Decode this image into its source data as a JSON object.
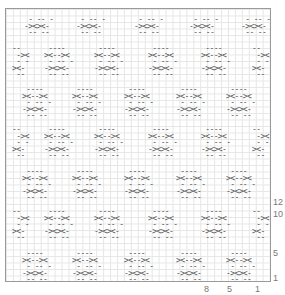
{
  "chart_data": {
    "type": "knitting-chart",
    "row_labels": [
      "12",
      "10",
      "5",
      "1"
    ],
    "col_labels": [
      "8",
      "5",
      "1"
    ],
    "motifs": {
      "a": [
        " - -- -",
        "-><><-",
        " -- --"
      ],
      "b": [
        " ----",
        "><--><",
        " - -- -",
        "-><><-",
        " -- --"
      ],
      "c": [
        "--",
        " -><",
        " - -",
        "><-",
        " --"
      ]
    },
    "rows": [
      {
        "y": 8,
        "items": [
          {
            "x": 18,
            "m": "a"
          },
          {
            "x": 70,
            "m": "a"
          },
          {
            "x": 128,
            "m": "a"
          },
          {
            "x": 183,
            "m": "a"
          },
          {
            "x": 235,
            "m": "a"
          }
        ]
      },
      {
        "y": 37,
        "items": [
          {
            "x": 6,
            "m": "c"
          },
          {
            "x": 38,
            "m": "b"
          },
          {
            "x": 88,
            "m": "b"
          },
          {
            "x": 142,
            "m": "b"
          },
          {
            "x": 195,
            "m": "b"
          },
          {
            "x": 246,
            "m": "c"
          }
        ]
      },
      {
        "y": 78,
        "items": [
          {
            "x": 16,
            "m": "b"
          },
          {
            "x": 66,
            "m": "b"
          },
          {
            "x": 118,
            "m": "b"
          },
          {
            "x": 170,
            "m": "b"
          },
          {
            "x": 220,
            "m": "b"
          }
        ]
      },
      {
        "y": 118,
        "items": [
          {
            "x": 6,
            "m": "c"
          },
          {
            "x": 38,
            "m": "b"
          },
          {
            "x": 88,
            "m": "b"
          },
          {
            "x": 142,
            "m": "b"
          },
          {
            "x": 195,
            "m": "b"
          },
          {
            "x": 246,
            "m": "c"
          }
        ]
      },
      {
        "y": 160,
        "items": [
          {
            "x": 16,
            "m": "b"
          },
          {
            "x": 66,
            "m": "b"
          },
          {
            "x": 118,
            "m": "b"
          },
          {
            "x": 170,
            "m": "b"
          },
          {
            "x": 220,
            "m": "b"
          }
        ]
      },
      {
        "y": 200,
        "items": [
          {
            "x": 6,
            "m": "c"
          },
          {
            "x": 38,
            "m": "b"
          },
          {
            "x": 88,
            "m": "b"
          },
          {
            "x": 142,
            "m": "b"
          },
          {
            "x": 195,
            "m": "b"
          },
          {
            "x": 246,
            "m": "c"
          }
        ]
      },
      {
        "y": 242,
        "items": [
          {
            "x": 16,
            "m": "b"
          },
          {
            "x": 66,
            "m": "b"
          },
          {
            "x": 118,
            "m": "b"
          },
          {
            "x": 170,
            "m": "b"
          },
          {
            "x": 220,
            "m": "b"
          }
        ]
      }
    ]
  },
  "labels": {
    "rows": [
      {
        "t": "12",
        "y": 197
      },
      {
        "t": "10",
        "y": 209
      },
      {
        "t": "5",
        "y": 248
      },
      {
        "t": "1",
        "y": 273
      }
    ],
    "cols": [
      {
        "t": "8",
        "x": 204
      },
      {
        "t": "5",
        "x": 227
      },
      {
        "t": "1",
        "x": 255
      }
    ]
  }
}
